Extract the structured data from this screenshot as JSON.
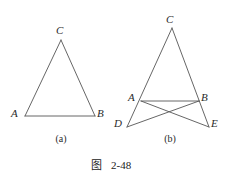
{
  "figure": {
    "caption_label": "图",
    "caption_number": "2-48",
    "stroke_color": "#555555",
    "label_color": "#2a2a2a",
    "background_color": "#ffffff"
  },
  "panels": [
    {
      "id": "a",
      "caption": "(a)",
      "caption_x": 61,
      "caption_y": 139,
      "vertices": [
        {
          "name": "C",
          "label": "C",
          "x": 61,
          "y": 40,
          "label_x": 56,
          "label_y": 25
        },
        {
          "name": "A",
          "label": "A",
          "x": 25,
          "y": 116,
          "label_x": 11,
          "label_y": 108
        },
        {
          "name": "B",
          "label": "B",
          "x": 95,
          "y": 116,
          "label_x": 97,
          "label_y": 108
        }
      ],
      "edges": [
        {
          "name": "CA",
          "from": "C",
          "to": "A"
        },
        {
          "name": "CB",
          "from": "C",
          "to": "B"
        },
        {
          "name": "AB",
          "from": "A",
          "to": "B"
        }
      ]
    },
    {
      "id": "b",
      "caption": "(b)",
      "caption_x": 170,
      "caption_y": 139,
      "vertices": [
        {
          "name": "C",
          "label": "C",
          "x": 172,
          "y": 28,
          "label_x": 166,
          "label_y": 14
        },
        {
          "name": "A",
          "label": "A",
          "x": 141,
          "y": 101,
          "label_x": 128,
          "label_y": 92
        },
        {
          "name": "B",
          "label": "B",
          "x": 199,
          "y": 101,
          "label_x": 201,
          "label_y": 92
        },
        {
          "name": "D",
          "label": "D",
          "x": 127,
          "y": 127,
          "label_x": 114,
          "label_y": 118
        },
        {
          "name": "E",
          "label": "E",
          "x": 209,
          "y": 127,
          "label_x": 211,
          "label_y": 118
        }
      ],
      "edges": [
        {
          "name": "CD",
          "from": "C",
          "to": "D"
        },
        {
          "name": "CE",
          "from": "C",
          "to": "E"
        },
        {
          "name": "AB",
          "from": "A",
          "to": "B"
        },
        {
          "name": "AE",
          "from": "A",
          "to": "E"
        },
        {
          "name": "BD",
          "from": "B",
          "to": "D"
        }
      ]
    }
  ]
}
